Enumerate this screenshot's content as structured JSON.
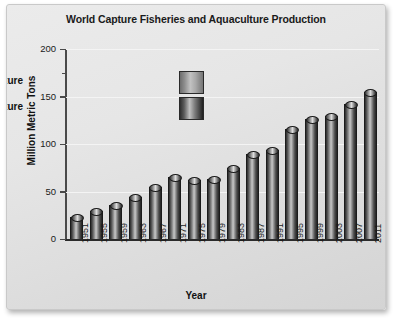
{
  "chart_data": {
    "type": "bar",
    "title": "World Capture Fisheries and Aquaculture Production",
    "xlabel": "Year",
    "ylabel": "Million Metric Tons",
    "ylim": [
      0,
      200
    ],
    "yticks": [
      0,
      50,
      100,
      150,
      200
    ],
    "ytick_labels": [
      "0",
      "50",
      "100",
      "150",
      "200"
    ],
    "grid": true,
    "legend_position": "upper-left-inside",
    "categories": [
      "1951",
      "1955",
      "1959",
      "1963",
      "1967",
      "1971",
      "1975",
      "1979",
      "1983",
      "1987",
      "1991",
      "1995",
      "1999",
      "2003",
      "2007",
      "2011"
    ],
    "values": [
      23,
      30,
      36,
      44,
      55,
      65,
      62,
      63,
      75,
      90,
      94,
      116,
      126,
      130,
      142,
      155
    ],
    "legend": [
      {
        "label": "Capture",
        "swatch": "capture-cylinder"
      },
      {
        "label": "Aquaculture",
        "swatch": "aquaculture-cylinder"
      }
    ],
    "colors": {
      "figure_background": "#e6e6e6",
      "bar_dark": "#2b2b2b",
      "bar_highlight": "#c9c9c9",
      "gridline": "#f4f4f4",
      "axis": "#2b2b2b",
      "text": "#111111"
    }
  }
}
